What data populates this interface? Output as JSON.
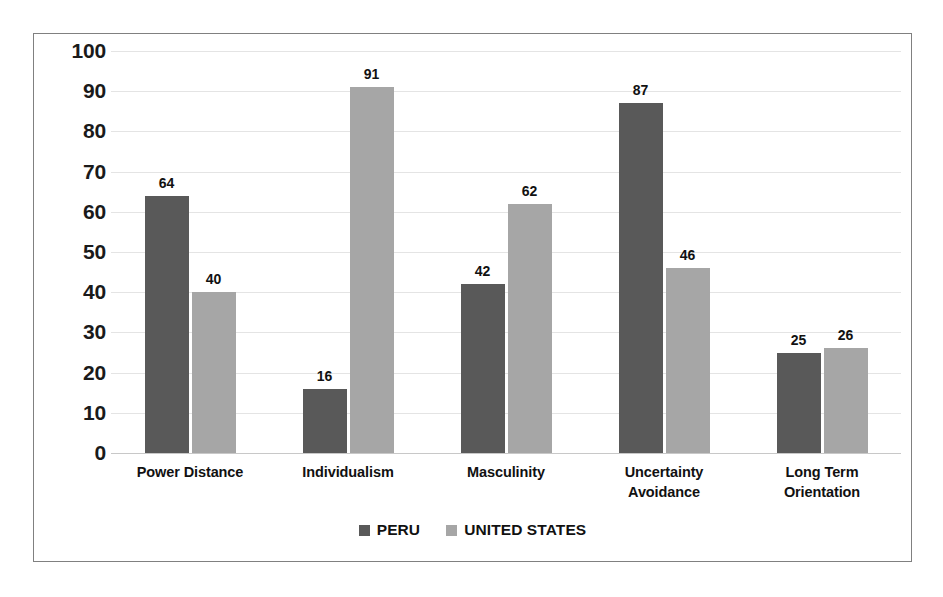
{
  "chart_data": {
    "type": "bar",
    "title": "",
    "xlabel": "",
    "ylabel": "",
    "ylim": [
      0,
      100
    ],
    "yticks": [
      100,
      90,
      80,
      70,
      60,
      50,
      40,
      30,
      20,
      10,
      0
    ],
    "grid": true,
    "legend_position": "bottom",
    "categories": [
      "Power Distance",
      "Individualism",
      "Masculinity",
      "Uncertainty Avoidance",
      "Long Term Orientation"
    ],
    "category_lines": [
      [
        "Power Distance"
      ],
      [
        "Individualism"
      ],
      [
        "Masculinity"
      ],
      [
        "Uncertainty",
        "Avoidance"
      ],
      [
        "Long Term",
        "Orientation"
      ]
    ],
    "series": [
      {
        "name": "PERU",
        "color": "#595959",
        "values": [
          64,
          16,
          42,
          87,
          25
        ]
      },
      {
        "name": "UNITED STATES",
        "color": "#a6a6a6",
        "values": [
          40,
          91,
          62,
          46,
          26
        ]
      }
    ]
  },
  "colors": {
    "border": "#808080",
    "gridline": "#e4e4e4",
    "baseline": "#c8c8c8",
    "text": "#111111",
    "background": "#ffffff"
  }
}
